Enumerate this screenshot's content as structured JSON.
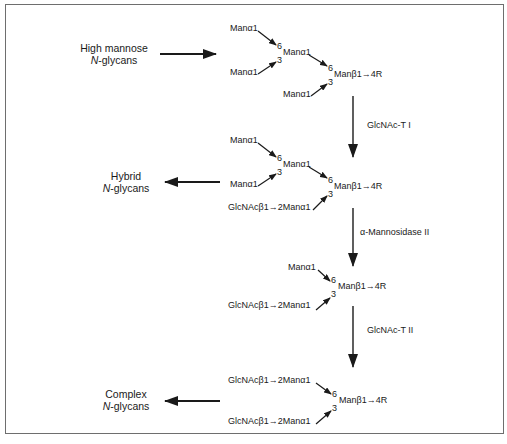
{
  "diagram": {
    "glycan_classes": {
      "high_mannose": {
        "line1": "High mannose",
        "line2_italic": "N",
        "line2_rest": "-glycans"
      },
      "hybrid": {
        "line1": "Hybrid",
        "line2_italic": "N",
        "line2_rest": "-glycans"
      },
      "complex": {
        "line1": "Complex",
        "line2_italic": "N",
        "line2_rest": "-glycans"
      }
    },
    "enzymes": {
      "step1": "GlcNAc-T I",
      "step2": "α-Mannosidase II",
      "step3": "GlcNAc-T II"
    },
    "structures": {
      "s1": {
        "man_a": "Manα1",
        "man_b": "Manα1",
        "man_branch": "Manα1",
        "man_c": "Manα1",
        "core": "Manβ1→4R",
        "link6_inner": "6",
        "link3_inner": "3",
        "link6_core": "6",
        "link3_core": "3"
      },
      "s2": {
        "man_a": "Manα1",
        "man_b": "Manα1",
        "man_branch": "Manα1",
        "glcnac_arm": "GlcNAcβ1→2Manα1",
        "core": "Manβ1→4R",
        "link6_inner": "6",
        "link3_inner": "3",
        "link6_core": "6",
        "link3_core": "3"
      },
      "s3": {
        "man_a": "Manα1",
        "glcnac_arm": "GlcNAcβ1→2Manα1",
        "core": "Manβ1→4R",
        "link6_core": "6",
        "link3_core": "3"
      },
      "s4": {
        "glcnac_arm_6": "GlcNAcβ1→2Manα1",
        "glcnac_arm_3": "GlcNAcβ1→2Manα1",
        "core": "Manβ1→4R",
        "link6_core": "6",
        "link3_core": "3"
      }
    },
    "colors": {
      "ink": "#1a1a1a",
      "frame": "#6e6e6e",
      "background": "#ffffff"
    }
  }
}
